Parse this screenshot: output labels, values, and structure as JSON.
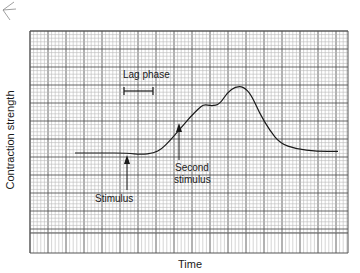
{
  "chart_data": {
    "type": "line",
    "title": "",
    "xlabel": "Time",
    "ylabel": "Contraction strength",
    "grid": true,
    "legend": null,
    "x_ticks": [],
    "y_ticks": [],
    "series": [
      {
        "name": "Muscle contraction",
        "points": [
          [
            0,
            0.0
          ],
          [
            10,
            0.0
          ],
          [
            20,
            0.0
          ],
          [
            25,
            -0.02
          ],
          [
            30,
            0.0
          ],
          [
            33,
            0.05
          ],
          [
            36,
            0.15
          ],
          [
            40,
            0.3
          ],
          [
            44,
            0.45
          ],
          [
            47,
            0.55
          ],
          [
            49,
            0.6
          ],
          [
            52,
            0.58
          ],
          [
            55,
            0.6
          ],
          [
            58,
            0.75
          ],
          [
            61,
            0.82
          ],
          [
            64,
            0.82
          ],
          [
            67,
            0.72
          ],
          [
            70,
            0.5
          ],
          [
            74,
            0.28
          ],
          [
            78,
            0.12
          ],
          [
            84,
            0.05
          ],
          [
            92,
            0.02
          ],
          [
            100,
            0.02
          ]
        ]
      }
    ],
    "annotations": [
      {
        "text": "Lag phase",
        "type": "bracket",
        "x_range": [
          17,
          25
        ]
      },
      {
        "text": "Stimulus",
        "type": "arrow",
        "x": 25
      },
      {
        "text": "Second stimulus",
        "type": "arrow",
        "x": 47
      }
    ]
  },
  "labels": {
    "xlabel": "Time",
    "ylabel": "Contraction strength",
    "lag_phase": "Lag phase",
    "stimulus": "Stimulus",
    "second_stimulus_line1": "Second",
    "second_stimulus_line2": "stimulus"
  },
  "colors": {
    "grid_minor": "#b8b8b8",
    "grid_major": "#555555",
    "curve": "#1a1a1a",
    "text": "#1a1a1a"
  }
}
